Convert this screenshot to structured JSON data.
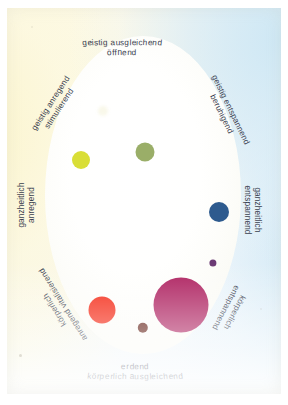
{
  "diagram": {
    "background": {
      "paper_cream": "#fdf8e0",
      "paper_blue": "#dceef8",
      "ellipse_fill": "#ffffff"
    },
    "labels": [
      {
        "id": "geistig-ausgleichend",
        "line1": "geistig ausgleichend",
        "line2": "öffnend",
        "position": "top",
        "style": "arc-down"
      },
      {
        "id": "geistig-anregend",
        "line1": "geistig anregend",
        "line2": "stimulierend",
        "position": "top-left",
        "style": "rotated",
        "rotation": -57
      },
      {
        "id": "geistig-entspannend",
        "line1": "geistig entspannend",
        "line2": "beruhigend",
        "position": "top-right",
        "style": "rotated",
        "rotation": 64
      },
      {
        "id": "ganzheitlich-anregend",
        "line1": "ganzheitlich",
        "line2": "anregend",
        "position": "left",
        "style": "rotated",
        "rotation": -90
      },
      {
        "id": "ganzheitlich-entspannend",
        "line1": "ganzheitlich",
        "line2": "entspannend",
        "position": "right",
        "style": "rotated",
        "rotation": 90
      },
      {
        "id": "koerperlich-anregend",
        "line1": "körperlich",
        "line2": "anregend vitalisierend",
        "position": "bottom-left",
        "style": "rotated",
        "rotation": -122
      },
      {
        "id": "koerperlich-entspannend",
        "line1": "körperlich",
        "line2": "entspannend",
        "position": "bottom-right",
        "style": "rotated",
        "rotation": 118
      },
      {
        "id": "erdend",
        "line1": "erdend",
        "line2": "körperlich ausgleichend",
        "position": "bottom",
        "style": "arc-up"
      }
    ],
    "dots": [
      {
        "id": "dot-pale-cream",
        "color": "#f7f6e3",
        "x": 103,
        "y": 111,
        "r": 5.0
      },
      {
        "id": "dot-yellow",
        "color": "#d9de36",
        "x": 81,
        "y": 160,
        "r": 9.0
      },
      {
        "id": "dot-olive",
        "color": "#9aae68",
        "x": 145,
        "y": 152,
        "r": 9.5
      },
      {
        "id": "dot-blue",
        "color": "#2d5a8e",
        "x": 219,
        "y": 212,
        "r": 10.0
      },
      {
        "id": "dot-violet",
        "color": "#6b3a74",
        "x": 213,
        "y": 263,
        "r": 3.6
      },
      {
        "id": "dot-magenta",
        "color": "#ad1f5e",
        "x": 181,
        "y": 305,
        "r": 27.5
      },
      {
        "id": "dot-red",
        "color": "#f42410",
        "x": 102,
        "y": 310,
        "r": 13.5
      },
      {
        "id": "dot-darkbrown",
        "color": "#5e1a10",
        "x": 143,
        "y": 328,
        "r": 5.2
      }
    ]
  }
}
